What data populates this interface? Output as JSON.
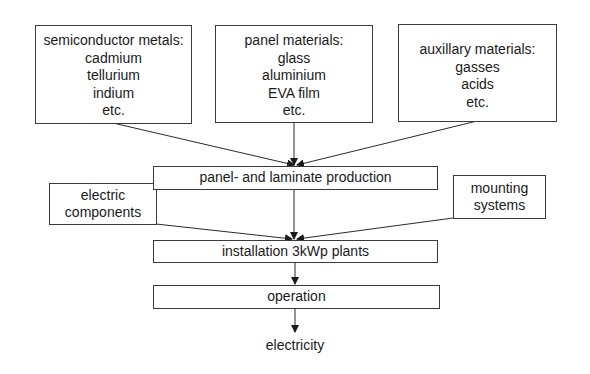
{
  "diagram": {
    "type": "flowchart",
    "inputs_top": [
      {
        "title": "semiconductor metals:",
        "items": [
          "cadmium",
          "tellurium",
          "indium",
          "etc."
        ]
      },
      {
        "title": "panel materials:",
        "items": [
          "glass",
          "aluminium",
          "EVA film",
          "etc."
        ]
      },
      {
        "title": "auxillary materials:",
        "items": [
          "gasses",
          "acids",
          "etc."
        ]
      }
    ],
    "side_inputs": {
      "electric_components": [
        "electric",
        "components"
      ],
      "mounting_systems": [
        "mounting",
        "systems"
      ]
    },
    "process_steps": [
      "panel- and laminate production",
      "installation 3kWp plants",
      "operation"
    ],
    "output": "electricity",
    "edges": [
      {
        "from": "semiconductor metals",
        "to": "panel- and laminate production"
      },
      {
        "from": "panel materials",
        "to": "panel- and laminate production"
      },
      {
        "from": "auxillary materials",
        "to": "panel- and laminate production"
      },
      {
        "from": "panel- and laminate production",
        "to": "installation 3kWp plants"
      },
      {
        "from": "electric components",
        "to": "installation 3kWp plants"
      },
      {
        "from": "mounting systems",
        "to": "installation 3kWp plants"
      },
      {
        "from": "installation 3kWp plants",
        "to": "operation"
      },
      {
        "from": "operation",
        "to": "electricity"
      }
    ],
    "colors": {
      "line": "#2a2a2a",
      "border": "#3a3a3a",
      "background": "#ffffff",
      "text": "#1a1a1a"
    }
  }
}
